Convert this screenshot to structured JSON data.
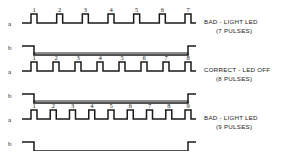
{
  "figure": {
    "title": "",
    "background_color": "#ffffff",
    "line_color": "#1a1a1a"
  },
  "chart_data": {
    "type": "line",
    "title": "",
    "xlabel": "",
    "ylabel": "",
    "grid": false,
    "legend": "none",
    "signal_names": [
      "a",
      "b"
    ],
    "rows": [
      {
        "id": "row-7-pulses",
        "caption_line1": "BAD - LIGHT LED",
        "caption_line2": "(7 PULSES)",
        "status": "bad",
        "pulse_count": 7,
        "pulse_numbers": [
          "1",
          "2",
          "3",
          "4",
          "5",
          "6",
          "7"
        ],
        "signal_a": {
          "name": "a",
          "idle_level": "low",
          "pulse_polarity": "positive"
        },
        "signal_b": {
          "name": "b",
          "idle_level": "high",
          "gate_polarity": "negative",
          "falling_edge_at_pulse": 1,
          "rising_edge_at_pulse": 7
        }
      },
      {
        "id": "row-8-pulses",
        "caption_line1": "CORRECT - LED OFF",
        "caption_line2": "(8 PULSES)",
        "status": "correct",
        "pulse_count": 8,
        "pulse_numbers": [
          "1",
          "2",
          "3",
          "4",
          "5",
          "6",
          "7",
          "8"
        ],
        "signal_a": {
          "name": "a",
          "idle_level": "low",
          "pulse_polarity": "positive"
        },
        "signal_b": {
          "name": "b",
          "idle_level": "high",
          "gate_polarity": "negative",
          "falling_edge_at_pulse": 1,
          "rising_edge_at_pulse": 8
        }
      },
      {
        "id": "row-9-pulses",
        "caption_line1": "BAD - LIGHT LED",
        "caption_line2": "(9 PULSES)",
        "status": "bad",
        "pulse_count": 9,
        "pulse_numbers": [
          "1",
          "2",
          "3",
          "4",
          "5",
          "6",
          "7",
          "8",
          "9"
        ],
        "signal_a": {
          "name": "a",
          "idle_level": "low",
          "pulse_polarity": "positive"
        },
        "signal_b": {
          "name": "b",
          "idle_level": "high",
          "gate_polarity": "negative",
          "falling_edge_at_pulse": 1,
          "rising_edge_at_pulse": 9
        }
      }
    ],
    "geometry": {
      "trace_x_start": 22,
      "trace_x_end": 196,
      "pulse_high_width": 6,
      "row_tops": [
        14,
        62,
        110
      ],
      "signal_a_offset": 9,
      "signal_b_offset": 32,
      "wave_amplitude": 9,
      "caption_x": 204
    }
  }
}
